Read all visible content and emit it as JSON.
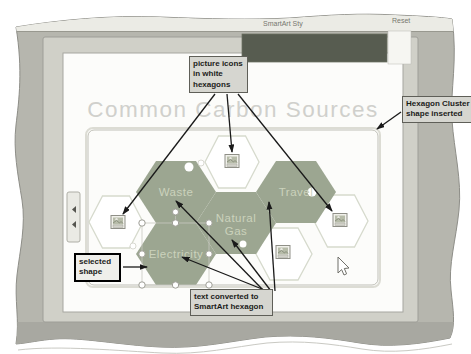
{
  "ribbon": {
    "smartart_styles_label": "SmartArt Sty",
    "reset_label": "Reset"
  },
  "slide": {
    "title": "Common Carbon Sources"
  },
  "smartart": {
    "hexagons": {
      "waste": "Waste",
      "travel": "Travel",
      "natural_gas_line1": "Natural",
      "natural_gas_line2": "Gas",
      "electricity": "Electricity"
    },
    "picture_icon_name": "picture-placeholder-icon"
  },
  "callouts": {
    "picture_icons": {
      "line1": "picture icons",
      "line2": "in white",
      "line3": "hexagons"
    },
    "hexagon_cluster": {
      "line1": "Hexagon Cluster",
      "line2": "shape inserted"
    },
    "selected_shape": {
      "line1": "selected",
      "line2": "shape"
    },
    "text_converted": {
      "line1": "text converted to",
      "line2": "SmartArt hexagon"
    }
  },
  "colors": {
    "hexagon_green": "#9ca691",
    "hexagon_text": "#cbd2bc",
    "dark_banner": "#575c50",
    "window_gray": "#b6b6ae",
    "canvas_frame": "#d0d0c8",
    "title_gray": "#d0d0cc",
    "callout_bg": "#d6d6d0",
    "arrow_black": "#1a1a1a"
  }
}
